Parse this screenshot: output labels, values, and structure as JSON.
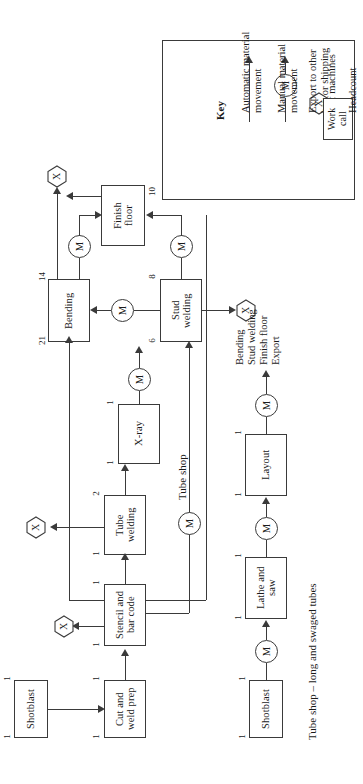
{
  "figure": {
    "type": "process-flow-diagram",
    "orientation": "rotated-90-counterclockwise",
    "captions": {
      "tube_shop": "Tube shop",
      "tube_shop_long": "Tube shop – long and swaged tubes"
    }
  },
  "key": {
    "title": "Key",
    "items": [
      {
        "symbol": "plain-arrow",
        "label": "Automatic material\nmovement"
      },
      {
        "symbol": "m-circle-arrow",
        "label": "Manual material\nmovement"
      },
      {
        "symbol": "hexagon-x",
        "label": "Export to other\nbay or shipping"
      },
      {
        "symbol": "number-top-left",
        "label": "# of machines"
      },
      {
        "symbol": "work-call-box",
        "label": "Headcount"
      }
    ],
    "work_call_label": "Work\ncall",
    "m_glyph": "M",
    "x_glyph": "X"
  },
  "nodes": [
    {
      "id": "shotblast_top",
      "label": "Shotblast",
      "machines": "1",
      "headcount": "1"
    },
    {
      "id": "cut_weld_prep",
      "label": "Cut and\nweld prep",
      "machines": "1",
      "headcount": "1"
    },
    {
      "id": "stencil_bar",
      "label": "Stencil and\nbar code",
      "machines": "1",
      "headcount": "1"
    },
    {
      "id": "tube_welding",
      "label": "Tube\nwelding",
      "machines": "2",
      "headcount": "1"
    },
    {
      "id": "xray",
      "label": "X-ray",
      "machines": "1",
      "headcount": "1"
    },
    {
      "id": "bending",
      "label": "Bending",
      "machines": "14",
      "headcount": "21"
    },
    {
      "id": "stud_welding",
      "label": "Stud\nwelding",
      "machines": "8",
      "headcount": "6"
    },
    {
      "id": "finish_floor",
      "label": "Finish\nfloor",
      "machines": "",
      "headcount": "10"
    },
    {
      "id": "shotblast_bot",
      "label": "Shotblast",
      "machines": "1",
      "headcount": "1"
    },
    {
      "id": "lathe_saw",
      "label": "Lathe and\nsaw",
      "machines": "1",
      "headcount": "1"
    },
    {
      "id": "layout",
      "label": "Layout",
      "machines": "1",
      "headcount": "1"
    }
  ],
  "export_nodes": [
    {
      "id": "export_stencil",
      "glyph": "X"
    },
    {
      "id": "export_tube",
      "glyph": "X"
    },
    {
      "id": "export_bending",
      "glyph": "X"
    },
    {
      "id": "export_stud",
      "glyph": "X"
    }
  ],
  "manual_moves": [
    {
      "id": "m_stencil_bending",
      "glyph": "M"
    },
    {
      "id": "m_stud_bending",
      "glyph": "M"
    },
    {
      "id": "m_bending_finish",
      "glyph": "M"
    },
    {
      "id": "m_stud_finish",
      "glyph": "M"
    },
    {
      "id": "m_tubeshop",
      "glyph": "M"
    },
    {
      "id": "m_shotblast_lathe",
      "glyph": "M"
    },
    {
      "id": "m_lathe_layout",
      "glyph": "M"
    },
    {
      "id": "m_layout_out",
      "glyph": "M"
    }
  ],
  "downstream_list": {
    "lines": [
      "Bending",
      "Stud welding",
      "Finish floor",
      "Export"
    ]
  }
}
